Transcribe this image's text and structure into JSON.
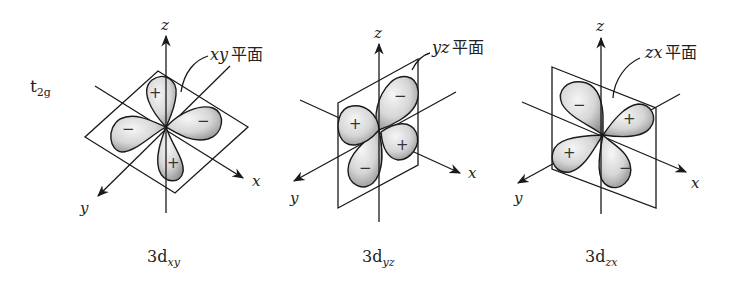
{
  "diagram": {
    "group_label": {
      "main": "t",
      "sub": "2g"
    },
    "colors": {
      "line": "#1a1a1a",
      "lobe_light": "#f4f4f4",
      "lobe_dark": "#9a9a9a",
      "background": "#ffffff"
    },
    "panels": [
      {
        "id": "dxy",
        "caption": {
          "main": "3d",
          "sub": "xy"
        },
        "plane_label": {
          "axes": "xy",
          "text": "平面"
        },
        "axis_labels": {
          "x": "x",
          "y": "y",
          "z": "z"
        },
        "lobe_signs": [
          "+",
          "−",
          "+",
          "−"
        ]
      },
      {
        "id": "dyz",
        "caption": {
          "main": "3d",
          "sub": "yz"
        },
        "plane_label": {
          "axes": "yz",
          "text": "平面"
        },
        "axis_labels": {
          "x": "x",
          "y": "y",
          "z": "z"
        },
        "lobe_signs": [
          "−",
          "+",
          "−",
          "+"
        ]
      },
      {
        "id": "dzx",
        "caption": {
          "main": "3d",
          "sub": "zx"
        },
        "plane_label": {
          "axes": "zx",
          "text": "平面"
        },
        "axis_labels": {
          "x": "x",
          "y": "y",
          "z": "z"
        },
        "lobe_signs": [
          "−",
          "+",
          "−",
          "+"
        ]
      }
    ]
  }
}
